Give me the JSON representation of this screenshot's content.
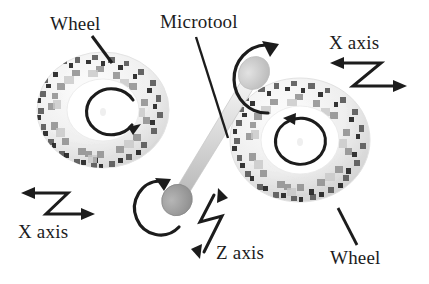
{
  "figure": {
    "background_color": "#ffffff",
    "ink_color": "#1c1c1c"
  },
  "labels": {
    "wheel_top_left": "Wheel",
    "microtool": "Microtool",
    "x_axis_top_right": "X axis",
    "x_axis_bottom_left": "X axis",
    "z_axis": "Z axis",
    "wheel_bottom_right": "Wheel"
  },
  "components": {
    "left_wheel": {
      "name": "Wheel",
      "rotation": "clockwise",
      "rim_texture": "speckled abrasive grit",
      "hub_color": "#ffffff",
      "rim_color": "#ededed"
    },
    "right_wheel": {
      "name": "Wheel",
      "rotation": "clockwise",
      "rim_texture": "speckled abrasive grit",
      "hub_color": "#ffffff",
      "rim_color": "#ededed"
    },
    "microtool": {
      "name": "Microtool",
      "shaft_color": "#d9d9d9",
      "tip_face_color": "#9a9a9a",
      "rotation_upper": "about tool axis",
      "rotation_lower": "about tool axis"
    }
  },
  "axes": [
    {
      "id": "x-axis-top-right",
      "label": "X axis",
      "glyph": "z-shaped-double-arrow",
      "orientation": "horizontal"
    },
    {
      "id": "x-axis-bottom-left",
      "label": "X axis",
      "glyph": "z-shaped-double-arrow",
      "orientation": "horizontal"
    },
    {
      "id": "z-axis",
      "label": "Z axis",
      "glyph": "z-shaped-double-arrow",
      "orientation": "vertical"
    }
  ]
}
